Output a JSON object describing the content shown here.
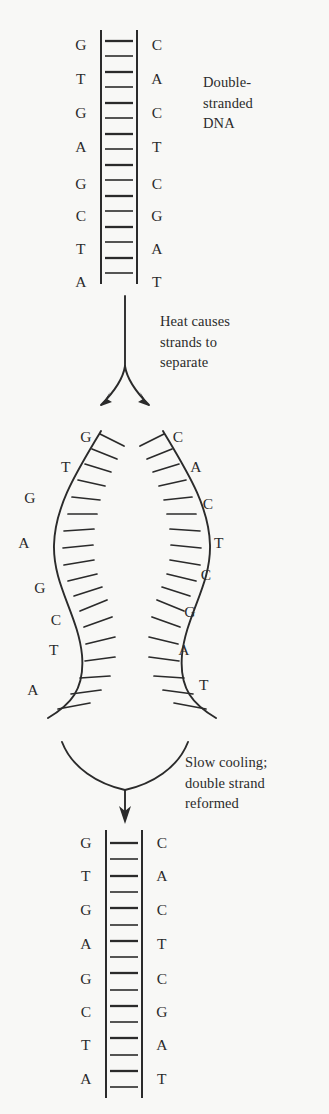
{
  "figure": {
    "background_color": "#f8f8f6",
    "ink_color": "#2b2b2b",
    "width": 329,
    "height": 1114
  },
  "captions": {
    "top": "Double-\nstranded\nDNA",
    "middle": "Heat causes\nstrands to\nseparate",
    "bottom": "Slow cooling;\ndouble strand\nreformed"
  },
  "panels": {
    "top_duplex": {
      "label": "double-stranded-dna-top",
      "left_strand": [
        "G",
        "T",
        "G",
        "A",
        "G",
        "C",
        "T",
        "A"
      ],
      "right_strand": [
        "C",
        "A",
        "C",
        "T",
        "C",
        "G",
        "A",
        "T"
      ],
      "rail_left_x": 101,
      "rail_right_x": 137,
      "rail_top_y": 30,
      "rail_bottom_y": 284,
      "letter_left_x": 81,
      "letter_right_x": 157,
      "letter_start_y": 45,
      "letter_spacing": 31,
      "rung_count": 16,
      "rung_top_y": 41,
      "rung_spacing": 15.5
    },
    "separated_strands": {
      "label": "separated-single-strands",
      "left_strand": [
        "G",
        "T",
        "G",
        "A",
        "G",
        "C",
        "T",
        "A"
      ],
      "right_strand": [
        "C",
        "A",
        "C",
        "T",
        "C",
        "G",
        "A",
        "T"
      ],
      "left_letter_positions": [
        {
          "x": 86,
          "y": 437
        },
        {
          "x": 66,
          "y": 467
        },
        {
          "x": 30,
          "y": 498
        },
        {
          "x": 24,
          "y": 543
        },
        {
          "x": 40,
          "y": 588
        },
        {
          "x": 56,
          "y": 620
        },
        {
          "x": 54,
          "y": 650
        },
        {
          "x": 33,
          "y": 690
        }
      ],
      "right_letter_positions": [
        {
          "x": 178,
          "y": 437
        },
        {
          "x": 196,
          "y": 467
        },
        {
          "x": 208,
          "y": 504
        },
        {
          "x": 219,
          "y": 543
        },
        {
          "x": 206,
          "y": 575
        },
        {
          "x": 190,
          "y": 612
        },
        {
          "x": 184,
          "y": 650
        },
        {
          "x": 204,
          "y": 685
        }
      ],
      "left_tick_count": 18,
      "right_tick_count": 18
    },
    "bottom_duplex": {
      "label": "double-stranded-dna-reformed",
      "left_strand": [
        "G",
        "T",
        "G",
        "A",
        "G",
        "C",
        "T",
        "A"
      ],
      "right_strand": [
        "C",
        "A",
        "C",
        "T",
        "C",
        "G",
        "A",
        "T"
      ],
      "rail_left_x": 106,
      "rail_right_x": 142,
      "rail_top_y": 830,
      "rail_bottom_y": 1098,
      "letter_left_x": 86,
      "letter_right_x": 162,
      "letter_start_y": 843,
      "letter_spacing": 32.5,
      "rung_count": 16,
      "rung_top_y": 840,
      "rung_spacing": 16.2
    }
  },
  "arrows": {
    "split": {
      "label": "heat-split-arrow",
      "description": "single stem forking into two diverging arrowheads",
      "stem_x": 125,
      "stem_top_y": 296,
      "fork_y": 365
    },
    "merge": {
      "label": "cooling-merge-arrow",
      "description": "two curves converging into one downward arrowhead",
      "stem_x": 125,
      "merge_y": 790,
      "arrow_tip_y": 822
    }
  }
}
